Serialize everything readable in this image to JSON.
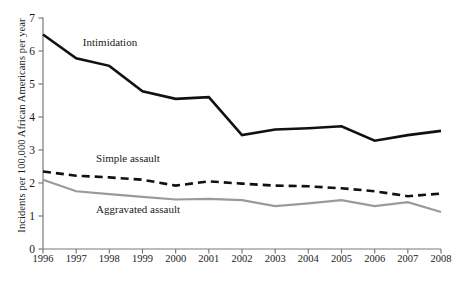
{
  "chart_data": {
    "type": "line",
    "title": "",
    "subtitle": "",
    "xlabel": "",
    "ylabel": "Incidents per 100,000 African Americans per year",
    "x": [
      1996,
      1997,
      1998,
      1999,
      2000,
      2001,
      2002,
      2003,
      2004,
      2005,
      2006,
      2007,
      2008
    ],
    "xtick_labels": [
      "1996",
      "1997",
      "1998",
      "1999",
      "2000",
      "2001",
      "2002",
      "2003",
      "2004",
      "2005",
      "2006",
      "2007",
      "2008"
    ],
    "ytick_labels": [
      "0",
      "1",
      "2",
      "3",
      "4",
      "5",
      "6",
      "7"
    ],
    "ytick_values": [
      0,
      1,
      2,
      3,
      4,
      5,
      6,
      7
    ],
    "xlim": [
      1996,
      2008
    ],
    "ylim": [
      0,
      7
    ],
    "grid": false,
    "legend_position": "inline-annotation",
    "series": [
      {
        "name": "Intimidation",
        "style": "solid",
        "color": "#111111",
        "width": 2.6,
        "label_x": 1997.2,
        "label_y": 6.25,
        "values": [
          6.5,
          5.78,
          5.55,
          4.78,
          4.55,
          4.6,
          3.45,
          3.62,
          3.66,
          3.72,
          3.28,
          3.45,
          3.58
        ]
      },
      {
        "name": "Simple assault",
        "style": "dashed",
        "color": "#111111",
        "width": 2.6,
        "label_x": 1997.6,
        "label_y": 2.72,
        "values": [
          2.35,
          2.22,
          2.17,
          2.1,
          1.92,
          2.05,
          1.98,
          1.92,
          1.9,
          1.84,
          1.75,
          1.6,
          1.68
        ]
      },
      {
        "name": "Aggravated assault",
        "style": "solid",
        "color": "#9a9a9a",
        "width": 2.2,
        "label_x": 1997.6,
        "label_y": 1.18,
        "values": [
          2.1,
          1.75,
          1.66,
          1.58,
          1.5,
          1.52,
          1.48,
          1.3,
          1.38,
          1.48,
          1.3,
          1.42,
          1.12
        ]
      }
    ]
  }
}
